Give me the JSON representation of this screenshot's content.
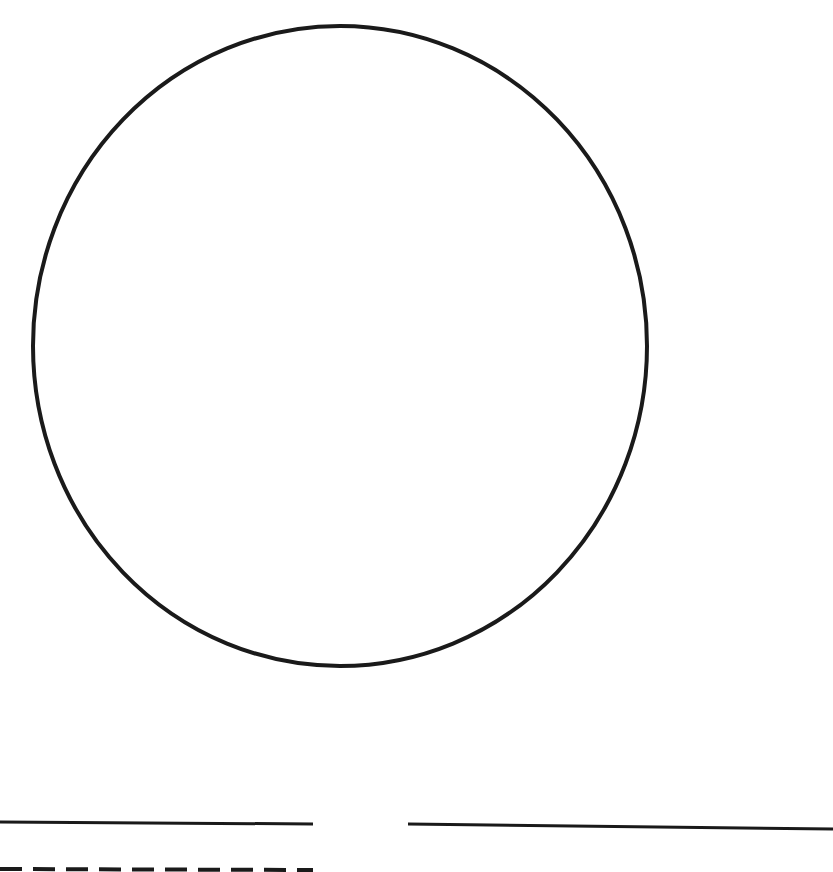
{
  "diagram": {
    "background": "#ffffff",
    "stroke_color": "#1a1a1a",
    "shapes": [
      {
        "id": "circle",
        "type": "ellipse",
        "cx": 340,
        "cy": 346,
        "rx": 307,
        "ry": 320,
        "stroke_width": 4
      },
      {
        "id": "solid-line-left",
        "type": "line",
        "x1": 0,
        "y1": 822,
        "x2": 313,
        "y2": 824,
        "stroke_width": 3,
        "dashed": false
      },
      {
        "id": "solid-line-right",
        "type": "line",
        "x1": 408,
        "y1": 824,
        "x2": 833,
        "y2": 829,
        "stroke_width": 3,
        "dashed": false
      },
      {
        "id": "dashed-line-left",
        "type": "line",
        "x1": 0,
        "y1": 869,
        "x2": 313,
        "y2": 870,
        "stroke_width": 4,
        "dashed": true,
        "dash": "22 11"
      }
    ]
  }
}
